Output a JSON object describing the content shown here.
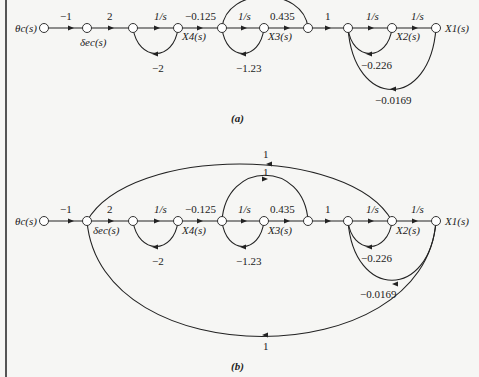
{
  "figure": {
    "panels": [
      {
        "id": "a",
        "caption": "(a)",
        "nodes": {
          "input": "θc(s)",
          "delta": "δec(s)",
          "x4": "X4(s)",
          "x3": "X3(s)",
          "x2": "X2(s)",
          "x1": "X1(s)"
        },
        "gains": {
          "g1": "−1",
          "g2": "2",
          "g3": "1/s",
          "fb_x4": "−2",
          "g4": "−0.125",
          "g5": "1/s",
          "ff_x3": "1",
          "fb_x3": "−1.23",
          "g6": "0.435",
          "g7": "1",
          "g8": "1/s",
          "g9": "1/s",
          "fb_x2": "−0.226",
          "fb_x1": "−0.0169"
        }
      },
      {
        "id": "b",
        "caption": "(b)",
        "nodes": {
          "input": "θc(s)",
          "delta": "δec(s)",
          "x4": "X4(s)",
          "x3": "X3(s)",
          "x2": "X2(s)",
          "x1": "X1(s)"
        },
        "gains": {
          "g1": "−1",
          "g2": "2",
          "g3": "1/s",
          "fb_x4": "−2",
          "g4": "−0.125",
          "g5": "1/s",
          "ff_x3": "1",
          "fb_x3": "−1.23",
          "g6": "0.435",
          "g7": "1",
          "g8": "1/s",
          "g9": "1/s",
          "fb_x2": "−0.226",
          "fb_x1": "−0.0169",
          "outer_top": "1",
          "outer_bottom": "1"
        }
      }
    ]
  }
}
